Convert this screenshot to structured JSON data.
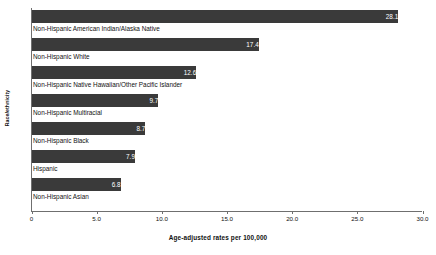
{
  "chart_data": {
    "type": "bar",
    "orientation": "horizontal",
    "title": "",
    "xlabel": "Age-adjusted rates per 100,000",
    "ylabel": "Race/ethnicity",
    "categories": [
      "Non-Hispanic American Indian/Alaska Native",
      "Non-Hispanic White",
      "Non-Hispanic Native Hawaiian/Other Pacific Islander",
      "Non-Hispanic Multiracial",
      "Non-Hispanic Black",
      "Hispanic",
      "Non-Hispanic Asian"
    ],
    "values": [
      28.1,
      17.4,
      12.6,
      9.7,
      8.7,
      7.9,
      6.8
    ],
    "value_labels": [
      "28.1",
      "17.4",
      "12.6",
      "9.7",
      "8.7",
      "7.9",
      "6.8"
    ],
    "xlim": [
      0,
      30
    ],
    "xticks": [
      0,
      5,
      10,
      15,
      20,
      25,
      30
    ],
    "xtick_labels": [
      "0",
      "5.0",
      "10.0",
      "15.0",
      "20.0",
      "25.0",
      "30.0"
    ],
    "grid": false,
    "legend": false,
    "bar_color": "#3a3a3a",
    "value_label_color": "#ffffff",
    "axis_color": "#6f6f6f",
    "background_color": "#ffffff"
  }
}
